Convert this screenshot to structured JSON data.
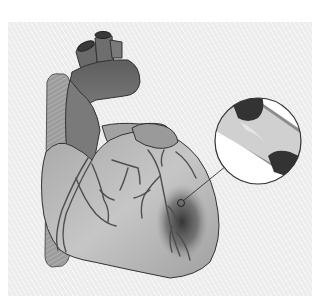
{
  "figure": {
    "panel_background": "#ececec",
    "colors": {
      "great_vessels": "#6e6e6e",
      "atrium": "#8a8a8a",
      "ventricle": "#b4b4b4",
      "vena_cava": "#a2a2a2",
      "coronary_vessels": "#555555",
      "ischemic_region": "#3a3a3a",
      "outline": "#3c3c3c",
      "artery_wall": "#8c8c8c",
      "plaque": "#333333",
      "lumen": "#d2d2d2",
      "magnifier_fill": "#ffffff"
    },
    "parts": [
      {
        "name": "aorta",
        "label": "aortic arch"
      },
      {
        "name": "superior-vena-cava",
        "label": "superior vena cava"
      },
      {
        "name": "pulmonary-artery",
        "label": "pulmonary artery"
      },
      {
        "name": "right-atrium",
        "label": "right atrium"
      },
      {
        "name": "left-ventricle",
        "label": "ventricles"
      },
      {
        "name": "coronary-arteries",
        "label": "coronary arteries"
      },
      {
        "name": "ischemic-area",
        "label": "blocked area"
      },
      {
        "name": "magnified-artery",
        "label": "narrowed artery with plaque"
      }
    ]
  }
}
